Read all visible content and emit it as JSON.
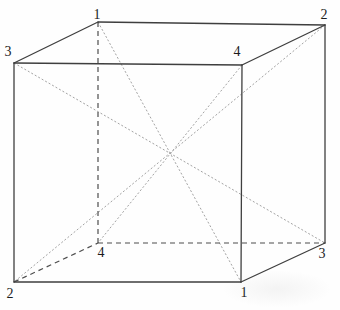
{
  "figure": {
    "width": 340,
    "height": 310,
    "colors": {
      "background": "#fefefe",
      "solid_edge": "#3f3f3f",
      "hidden_edge": "#4d4d4d",
      "diagonal": "#a3a3a3",
      "label": "#1c1c1c"
    },
    "vertices": [
      {
        "label": "1",
        "role": "back-top-left",
        "x": 98,
        "y": 22,
        "lx": 97,
        "ly": 19
      },
      {
        "label": "2",
        "role": "back-top-right",
        "x": 325,
        "y": 25,
        "lx": 324,
        "ly": 19
      },
      {
        "label": "3",
        "role": "front-top-left",
        "x": 14,
        "y": 63,
        "lx": 8,
        "ly": 56
      },
      {
        "label": "4",
        "role": "front-top-right",
        "x": 242,
        "y": 65,
        "lx": 237,
        "ly": 56
      },
      {
        "label": "2",
        "role": "front-bottom-left",
        "x": 14,
        "y": 282,
        "lx": 10,
        "ly": 298
      },
      {
        "label": "1",
        "role": "front-bottom-right",
        "x": 241,
        "y": 282,
        "lx": 244,
        "ly": 297
      },
      {
        "label": "4",
        "role": "back-bottom-left",
        "x": 98,
        "y": 243,
        "lx": 101,
        "ly": 257
      },
      {
        "label": "3",
        "role": "back-bottom-right",
        "x": 325,
        "y": 243,
        "lx": 322,
        "ly": 258
      }
    ],
    "solid_edges": [
      {
        "name": "back-top",
        "x1": 98,
        "y1": 22,
        "x2": 325,
        "y2": 25
      },
      {
        "name": "front-top",
        "x1": 14,
        "y1": 63,
        "x2": 242,
        "y2": 65
      },
      {
        "name": "left-top-depth",
        "x1": 14,
        "y1": 63,
        "x2": 98,
        "y2": 22
      },
      {
        "name": "right-top-depth",
        "x1": 242,
        "y1": 65,
        "x2": 325,
        "y2": 25
      },
      {
        "name": "front-left-vertical",
        "x1": 14,
        "y1": 63,
        "x2": 14,
        "y2": 282
      },
      {
        "name": "front-right-vertical",
        "x1": 242,
        "y1": 65,
        "x2": 241,
        "y2": 282
      },
      {
        "name": "back-right-vertical",
        "x1": 325,
        "y1": 25,
        "x2": 325,
        "y2": 243
      },
      {
        "name": "front-bottom",
        "x1": 14,
        "y1": 282,
        "x2": 241,
        "y2": 282
      },
      {
        "name": "right-bottom-depth",
        "x1": 241,
        "y1": 282,
        "x2": 325,
        "y2": 243
      }
    ],
    "hidden_edges": [
      {
        "name": "back-left-vertical",
        "x1": 98,
        "y1": 22,
        "x2": 98,
        "y2": 243
      },
      {
        "name": "back-bottom",
        "x1": 98,
        "y1": 243,
        "x2": 325,
        "y2": 243
      },
      {
        "name": "left-bottom-depth",
        "x1": 14,
        "y1": 282,
        "x2": 98,
        "y2": 243
      }
    ],
    "space_diagonals": [
      {
        "name": "diagonal-1-1",
        "x1": 98,
        "y1": 22,
        "x2": 241,
        "y2": 282
      },
      {
        "name": "diagonal-2-2",
        "x1": 325,
        "y1": 25,
        "x2": 14,
        "y2": 282
      },
      {
        "name": "diagonal-3-3",
        "x1": 14,
        "y1": 63,
        "x2": 325,
        "y2": 243
      },
      {
        "name": "diagonal-4-4",
        "x1": 242,
        "y1": 65,
        "x2": 98,
        "y2": 243
      }
    ]
  }
}
